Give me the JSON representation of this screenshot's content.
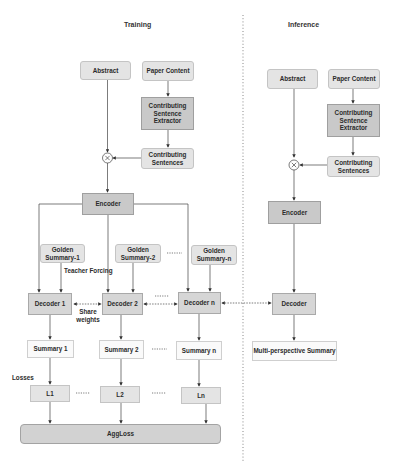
{
  "sections": {
    "training": {
      "title": "Training"
    },
    "inference": {
      "title": "Inference"
    }
  },
  "training": {
    "abstract": "Abstract",
    "paper_content": "Paper Content",
    "extractor": "Contributing Sentence Extractor",
    "contributing_sentences": "Contributing Sentences",
    "combine_symbol": "⊗",
    "encoder": "Encoder",
    "golden_summaries": [
      "Golden Summary-1",
      "Golden Summary-2",
      "Golden Summary-n"
    ],
    "teacher_forcing": "Teacher Forcing",
    "decoders": [
      "Decoder 1",
      "Decoder 2",
      "Decoder n"
    ],
    "share_weights": "Share weights",
    "summaries": [
      "Summary 1",
      "Summary 2",
      "Summary n"
    ],
    "losses_label": "Losses",
    "losses": [
      "L1",
      "L2",
      "Ln"
    ],
    "agg_loss": "AggLoss",
    "ellipsis": "·····"
  },
  "inference": {
    "abstract": "Abstract",
    "paper_content": "Paper Content",
    "extractor": "Contributing Sentence Extractor",
    "contributing_sentences": "Contributing Sentences",
    "combine_symbol": "⊗",
    "encoder": "Encoder",
    "decoder": "Decoder",
    "output": "Multi-perspective Summary"
  },
  "colors": {
    "light_box": "#e4e4e4",
    "dark_box": "#c9c9c9",
    "white_box": "#fafafa",
    "line": "#444444"
  }
}
